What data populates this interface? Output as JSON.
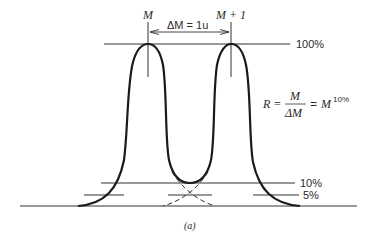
{
  "diagram": {
    "peak_left_label": "M",
    "peak_right_label": "M + 1",
    "delta_label": "ΔM = 1u",
    "level_100": "100%",
    "level_10": "10%",
    "level_5": "5%",
    "formula": {
      "lhs": "R =",
      "numerator": "M",
      "denominator": "ΔM",
      "equals": "=",
      "rhs_base": "M",
      "rhs_superscript": "10%"
    },
    "caption": "(a)"
  },
  "colors": {
    "line": "#1a1a1a",
    "text": "#2a2a2a",
    "background": "#ffffff"
  }
}
